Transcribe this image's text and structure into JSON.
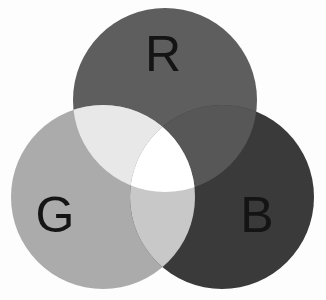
{
  "figure": {
    "width": 326,
    "height": 300,
    "background_color": "#fdfdfd"
  },
  "chart_data": {
    "type": "venn",
    "subtitle": "",
    "xlabel": "",
    "ylabel": "",
    "grid": false,
    "legend_position": "none",
    "set_count": 3,
    "sets": [
      {
        "id": "R",
        "label": "R",
        "name": "Red",
        "fill": "#5e5e5e",
        "cx": 165,
        "cy": 100,
        "r": 92,
        "label_x": 163,
        "label_y": 58
      },
      {
        "id": "G",
        "label": "G",
        "name": "Green",
        "fill": "#ababab",
        "cx": 103,
        "cy": 197,
        "r": 92,
        "label_x": 55,
        "label_y": 219
      },
      {
        "id": "B",
        "label": "B",
        "name": "Blue",
        "fill": "#3a3a3a",
        "cx": 222,
        "cy": 197,
        "r": 92,
        "label_x": 257,
        "label_y": 219
      }
    ],
    "regions": [
      {
        "id": "R",
        "members": [
          "R"
        ],
        "mix_name": "Red",
        "fill": "#5e5e5e"
      },
      {
        "id": "G",
        "members": [
          "G"
        ],
        "mix_name": "Green",
        "fill": "#ababab"
      },
      {
        "id": "B",
        "members": [
          "B"
        ],
        "mix_name": "Blue",
        "fill": "#3a3a3a"
      },
      {
        "id": "RG",
        "members": [
          "R",
          "G"
        ],
        "mix_name": "Yellow",
        "fill": "#e8e8e8"
      },
      {
        "id": "RB",
        "members": [
          "R",
          "B"
        ],
        "mix_name": "Magenta",
        "fill": "#575757"
      },
      {
        "id": "GB",
        "members": [
          "G",
          "B"
        ],
        "mix_name": "Cyan",
        "fill": "#c8c8c8"
      },
      {
        "id": "RGB",
        "members": [
          "R",
          "G",
          "B"
        ],
        "mix_name": "White",
        "fill": "#ffffff"
      }
    ],
    "label_color": "#141414",
    "label_font_size": 50
  }
}
